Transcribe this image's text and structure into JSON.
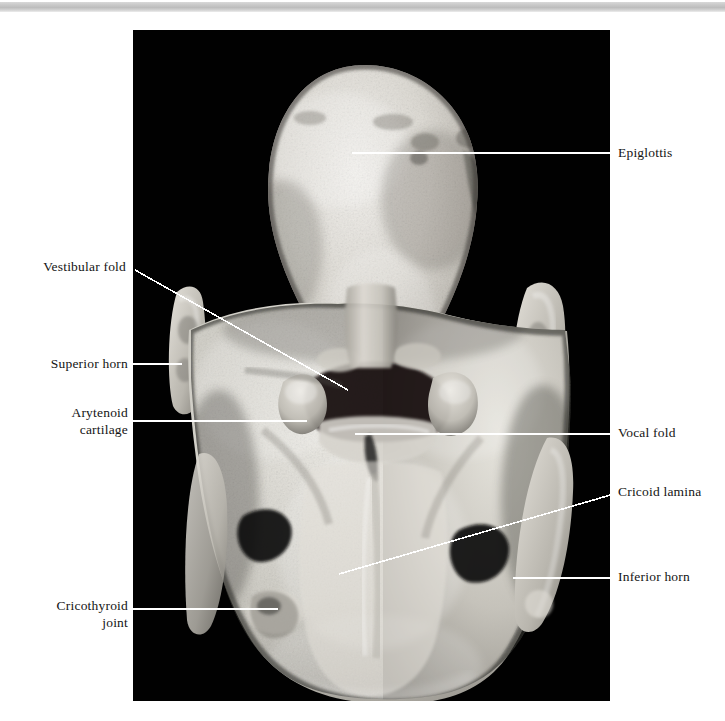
{
  "figure": {
    "kind": "anatomical-photograph",
    "plate_background": "#000000",
    "page_background": "#ffffff",
    "leader_color": "#ffffff",
    "label_color": "#141414",
    "top_rule_color": "#c9c9c9"
  },
  "labels": {
    "right": [
      {
        "id": "epiglottis",
        "text": "Epiglottis",
        "x": 618,
        "y": 145
      },
      {
        "id": "vocal-fold",
        "text": "Vocal fold",
        "x": 618,
        "y": 425
      },
      {
        "id": "cricoid-lamina",
        "text": "Cricoid lamina",
        "x": 618,
        "y": 484
      },
      {
        "id": "inferior-horn",
        "text": "Inferior horn",
        "x": 618,
        "y": 569
      }
    ],
    "left": [
      {
        "id": "vestibular-fold",
        "text": "Vestibular fold",
        "x": 42,
        "y": 259,
        "lines": 1
      },
      {
        "id": "superior-horn",
        "text": "Superior horn",
        "x": 44,
        "y": 354,
        "lines": 1
      },
      {
        "id": "arytenoid-cartilage",
        "text": "Arytenoid\ncartilage",
        "x": 65,
        "y": 405,
        "lines": 2
      },
      {
        "id": "cricothyroid-joint",
        "text": "Cricothyroid\njoint",
        "x": 50,
        "y": 596,
        "lines": 2
      }
    ]
  },
  "leader_lines": [
    {
      "id": "epiglottis-leader",
      "x1": 352,
      "y1": 153,
      "x2": 614,
      "y2": 153
    },
    {
      "id": "vocal-fold-leader",
      "x1": 355,
      "y1": 434,
      "x2": 614,
      "y2": 434
    },
    {
      "id": "cricoid-lamina-leader",
      "x1": 339,
      "y1": 574,
      "x2": 614,
      "y2": 494
    },
    {
      "id": "inferior-horn-leader",
      "x1": 513,
      "y1": 578,
      "x2": 614,
      "y2": 578
    },
    {
      "id": "vestibular-fold-leader",
      "x1": 135,
      "y1": 270,
      "x2": 348,
      "y2": 390
    },
    {
      "id": "superior-horn-leader",
      "x1": 133,
      "y1": 364,
      "x2": 182,
      "y2": 364
    },
    {
      "id": "arytenoid-leader",
      "x1": 133,
      "y1": 421,
      "x2": 307,
      "y2": 421
    },
    {
      "id": "cricothyroid-leader",
      "x1": 133,
      "y1": 609,
      "x2": 278,
      "y2": 609
    }
  ],
  "photo": {
    "left": 133,
    "top": 30,
    "width": 477,
    "height": 671
  }
}
